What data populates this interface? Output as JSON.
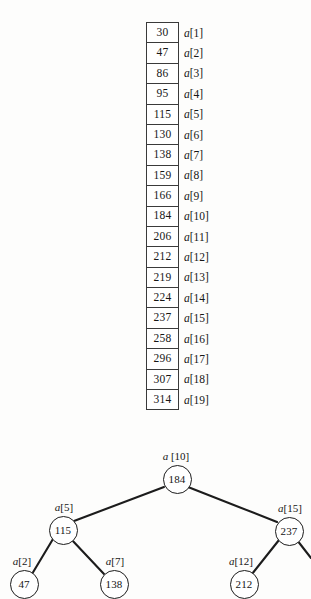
{
  "figure": {
    "array": {
      "name": "a",
      "cells": [
        {
          "value": "30",
          "label": "a[1]"
        },
        {
          "value": "47",
          "label": "a[2]"
        },
        {
          "value": "86",
          "label": "a[3]"
        },
        {
          "value": "95",
          "label": "a[4]"
        },
        {
          "value": "115",
          "label": "a[5]"
        },
        {
          "value": "130",
          "label": "a[6]"
        },
        {
          "value": "138",
          "label": "a[7]"
        },
        {
          "value": "159",
          "label": "a[8]"
        },
        {
          "value": "166",
          "label": "a[9]"
        },
        {
          "value": "184",
          "label": "a[10]"
        },
        {
          "value": "206",
          "label": "a[11]"
        },
        {
          "value": "212",
          "label": "a[12]"
        },
        {
          "value": "219",
          "label": "a[13]"
        },
        {
          "value": "224",
          "label": "a[14]"
        },
        {
          "value": "237",
          "label": "a[15]"
        },
        {
          "value": "258",
          "label": "a[16]"
        },
        {
          "value": "296",
          "label": "a[17]"
        },
        {
          "value": "307",
          "label": "a[18]"
        },
        {
          "value": "314",
          "label": "a[19]"
        }
      ]
    },
    "tree": {
      "nodes": [
        {
          "id": "root",
          "value": "184",
          "tag": "a [10]",
          "x": 176,
          "y": 38,
          "tag_x": 176,
          "tag_y": 22
        },
        {
          "id": "left",
          "value": "115",
          "tag": "a[5]",
          "x": 62,
          "y": 89,
          "tag_x": 64,
          "tag_y": 73
        },
        {
          "id": "right",
          "value": "237",
          "tag": "a[15]",
          "x": 288,
          "y": 90,
          "tag_x": 290,
          "tag_y": 74
        },
        {
          "id": "ll",
          "value": "47",
          "tag": "a[2]",
          "x": 23,
          "y": 143,
          "tag_x": 22,
          "tag_y": 127
        },
        {
          "id": "lr",
          "value": "138",
          "tag": "a[7]",
          "x": 113,
          "y": 143,
          "tag_x": 115,
          "tag_y": 127
        },
        {
          "id": "rl",
          "value": "212",
          "tag": "a[12]",
          "x": 243,
          "y": 143,
          "tag_x": 241,
          "tag_y": 127
        }
      ],
      "edges": [
        {
          "from": "root",
          "to": "left",
          "x1": 164,
          "y1": 47,
          "x2": 74,
          "y2": 81
        },
        {
          "from": "root",
          "to": "right",
          "x1": 188,
          "y1": 47,
          "x2": 277,
          "y2": 82
        },
        {
          "from": "left",
          "to": "ll",
          "x1": 53,
          "y1": 99,
          "x2": 32,
          "y2": 134
        },
        {
          "from": "left",
          "to": "lr",
          "x1": 71,
          "y1": 99,
          "x2": 104,
          "y2": 134
        },
        {
          "from": "right",
          "to": "rl",
          "x1": 279,
          "y1": 100,
          "x2": 252,
          "y2": 134
        },
        {
          "from": "right",
          "to": "rr",
          "x1": 297,
          "y1": 100,
          "x2": 311,
          "y2": 118
        }
      ]
    }
  },
  "style": {
    "stroke": "#1c1c1c",
    "cell_border": "#3a3a3a",
    "background": "#fdfdfc"
  }
}
